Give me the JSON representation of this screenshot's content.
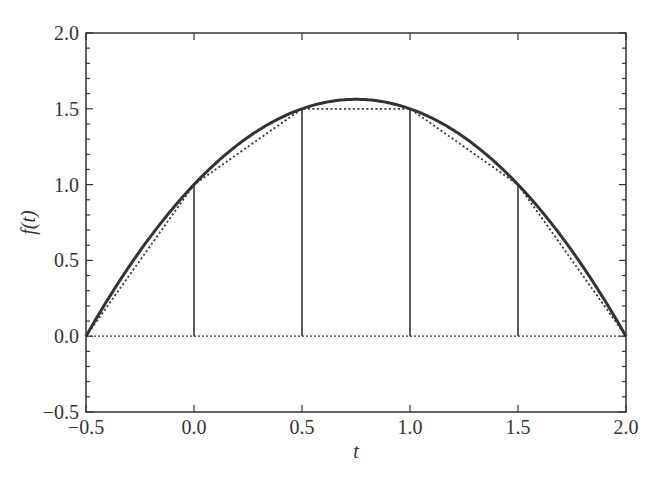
{
  "chart_data": {
    "type": "line",
    "title": "",
    "xlabel": "t",
    "ylabel": "f(t)",
    "xlim": [
      -0.5,
      2.0
    ],
    "ylim": [
      -0.5,
      2.0
    ],
    "xticks": [
      "−0.5",
      "0.0",
      "0.5",
      "1.0",
      "1.5",
      "2.0"
    ],
    "yticks": [
      "−0.5",
      "0.0",
      "0.5",
      "1.0",
      "1.5",
      "2.0"
    ],
    "grid": false,
    "legend": null,
    "series": [
      {
        "name": "f(t) = 1 + 1.5t − t²",
        "style": "solid-thick",
        "x": [
          -0.5,
          -0.25,
          0.0,
          0.25,
          0.5,
          0.75,
          1.0,
          1.25,
          1.5,
          1.75,
          2.0
        ],
        "y": [
          0.0,
          0.5625,
          1.0,
          1.3125,
          1.5,
          1.5625,
          1.5,
          1.3125,
          1.0,
          0.5625,
          0.0
        ]
      },
      {
        "name": "piecewise linear interpolation",
        "style": "dotted",
        "x": [
          -0.5,
          0.0,
          0.5,
          1.0,
          1.5,
          2.0
        ],
        "y": [
          0.0,
          1.0,
          1.5,
          1.5,
          1.0,
          0.0
        ]
      },
      {
        "name": "baseline",
        "style": "dotted",
        "x": [
          -0.5,
          2.0
        ],
        "y": [
          0.0,
          0.0
        ]
      },
      {
        "name": "vertical lines at nodes",
        "style": "solid-thin",
        "x": [
          0.0,
          0.5,
          1.0,
          1.5
        ],
        "y": [
          1.0,
          1.5,
          1.5,
          1.0
        ]
      }
    ]
  },
  "axes": {
    "xlabel": "t",
    "ylabel": "f(t)"
  }
}
